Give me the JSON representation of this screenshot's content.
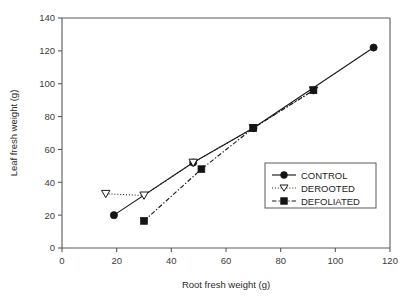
{
  "chart_data": {
    "type": "scatter",
    "title": "",
    "xlabel": "Root fresh weight (g)",
    "ylabel": "Leaf fresh weight (g)",
    "xlim": [
      0,
      120
    ],
    "ylim": [
      0,
      140
    ],
    "xticks": [
      0,
      20,
      40,
      60,
      80,
      100,
      120
    ],
    "yticks": [
      0,
      20,
      40,
      60,
      80,
      100,
      120,
      140
    ],
    "xtick_labels": [
      "0",
      "20",
      "40",
      "60",
      "80",
      "100",
      "120"
    ],
    "ytick_labels": [
      "0",
      "20",
      "40",
      "60",
      "80",
      "100",
      "120",
      "140"
    ],
    "grid": false,
    "legend_position": "lower right",
    "series": [
      {
        "name": "CONTROL",
        "marker": "filled-circle",
        "line_style": "solid",
        "color": "#141414",
        "points": [
          {
            "x": 19,
            "y": 20
          },
          {
            "x": 48,
            "y": 52
          },
          {
            "x": 70,
            "y": 73
          },
          {
            "x": 114,
            "y": 122
          }
        ]
      },
      {
        "name": "DEROOTED",
        "marker": "open-triangle-down",
        "line_style": "dotted",
        "color": "#141414",
        "points": [
          {
            "x": 16,
            "y": 33
          },
          {
            "x": 30,
            "y": 32
          },
          {
            "x": 48,
            "y": 52
          },
          {
            "x": 70,
            "y": 73
          },
          {
            "x": 92,
            "y": 96
          }
        ]
      },
      {
        "name": "DEFOLIATED",
        "marker": "filled-square",
        "line_style": "dash-dot",
        "color": "#141414",
        "points": [
          {
            "x": 30,
            "y": 16.5
          },
          {
            "x": 51,
            "y": 48
          },
          {
            "x": 70,
            "y": 73
          },
          {
            "x": 92,
            "y": 96
          }
        ]
      }
    ]
  },
  "legend": {
    "entries": [
      {
        "label": "CONTROL"
      },
      {
        "label": "DEROOTED"
      },
      {
        "label": "DEFOLIATED"
      }
    ]
  }
}
